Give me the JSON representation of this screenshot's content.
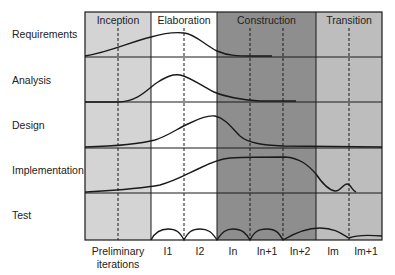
{
  "colors": {
    "inception": "#d4d4d4",
    "elaboration": "#ffffff",
    "construction": "#8e8e8e",
    "transition": "#bdbdbd",
    "line": "#1a1a1a"
  },
  "phases": [
    {
      "name": "Inception",
      "x0": 85,
      "x1": 151
    },
    {
      "name": "Elaboration",
      "x0": 151,
      "x1": 217
    },
    {
      "name": "Construction",
      "x0": 217,
      "x1": 316
    },
    {
      "name": "Transition",
      "x0": 316,
      "x1": 382
    }
  ],
  "workflows": [
    {
      "name": "Requirements",
      "y0": 12,
      "y1": 57
    },
    {
      "name": "Analysis",
      "y0": 57,
      "y1": 102
    },
    {
      "name": "Design",
      "y0": 102,
      "y1": 148
    },
    {
      "name": "Implementation",
      "y0": 148,
      "y1": 193
    },
    {
      "name": "Test",
      "y0": 193,
      "y1": 240
    }
  ],
  "iterations": [
    {
      "label": "Preliminary\niterations",
      "line1": "Preliminary",
      "line2": "iterations",
      "x": 118
    },
    {
      "label": "I1",
      "line1": "I1",
      "x": 168
    },
    {
      "label": "I2",
      "line1": "I2",
      "x": 200
    },
    {
      "label": "In",
      "line1": "In",
      "x": 233
    },
    {
      "label": "In+1",
      "line1": "In+1",
      "x": 267
    },
    {
      "label": "In+2",
      "line1": "In+2",
      "x": 300
    },
    {
      "label": "Im",
      "line1": "Im",
      "x": 333
    },
    {
      "label": "Im+1",
      "line1": "Im+1",
      "x": 366
    }
  ],
  "dashed_x": [
    118,
    184,
    250,
    283,
    349
  ]
}
